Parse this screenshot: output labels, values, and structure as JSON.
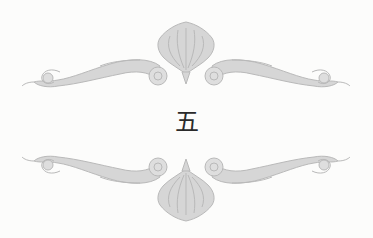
{
  "chapter": {
    "number": "五"
  },
  "ornaments": {
    "top": "scroll-flourish-ornament",
    "bottom": "scroll-flourish-ornament-mirrored"
  },
  "colors": {
    "background": "#fcfcfb",
    "ornament_fill": "#d2d2d2",
    "ornament_stroke": "#b8b8b8",
    "text": "#2a2a2a"
  }
}
